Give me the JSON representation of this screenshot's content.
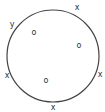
{
  "diagram": {
    "circle": {
      "cx": 53,
      "cy": 56,
      "r": 46,
      "stroke": "#444444"
    },
    "boundary_points": [
      {
        "label": "x",
        "x": 77,
        "y": 7
      },
      {
        "label": "y",
        "x": 12,
        "y": 24
      },
      {
        "label": "x",
        "x": 7,
        "y": 75
      },
      {
        "label": "x",
        "x": 100,
        "y": 74
      },
      {
        "label": "x",
        "x": 53,
        "y": 107
      }
    ],
    "interior_points": [
      {
        "label": "o",
        "x": 34,
        "y": 32
      },
      {
        "label": "o",
        "x": 79,
        "y": 45
      },
      {
        "label": "o",
        "x": 46,
        "y": 80
      }
    ]
  }
}
